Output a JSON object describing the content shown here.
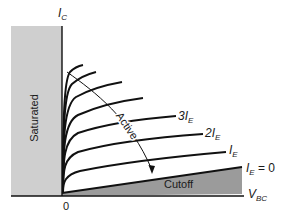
{
  "diagram": {
    "y_axis_label": "I",
    "y_axis_sub": "C",
    "x_axis_label": "V",
    "x_axis_sub": "BC",
    "origin_label": "0",
    "regions": {
      "saturated": "Saturated",
      "active": "Active",
      "cutoff": "Cutoff"
    },
    "curve_labels": [
      {
        "main": "3I",
        "sub": "E",
        "suffix": ""
      },
      {
        "main": "2I",
        "sub": "E",
        "suffix": ""
      },
      {
        "main": "I",
        "sub": "E",
        "suffix": ""
      },
      {
        "main": "I",
        "sub": "E",
        "suffix": " = 0"
      }
    ],
    "colors": {
      "saturated_fill": "#cfcfcf",
      "cutoff_fill": "#9b9b9b",
      "line": "#111111",
      "background": "#ffffff"
    }
  }
}
